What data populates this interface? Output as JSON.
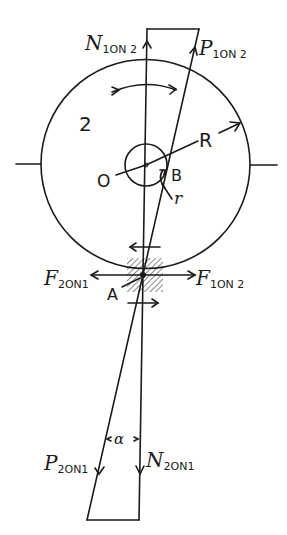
{
  "diagram": {
    "labels": {
      "n1on2": {
        "main": "N",
        "sub": "1ON 2"
      },
      "p1on2": {
        "main": "P",
        "sub": "1ON 2"
      },
      "body": "2",
      "R": "R",
      "O": "O",
      "B": "B",
      "r": "r",
      "f2on1": {
        "main": "F",
        "sub": "2ON1"
      },
      "f1on2": {
        "main": "F",
        "sub": "1ON 2"
      },
      "A": "A",
      "alpha": "α",
      "p2on1": {
        "main": "P",
        "sub": "2ON1"
      },
      "n2on1": {
        "main": "N",
        "sub": "2ON1"
      }
    },
    "colors": {
      "ink": "#1a1a1a",
      "background": "#ffffff"
    }
  }
}
